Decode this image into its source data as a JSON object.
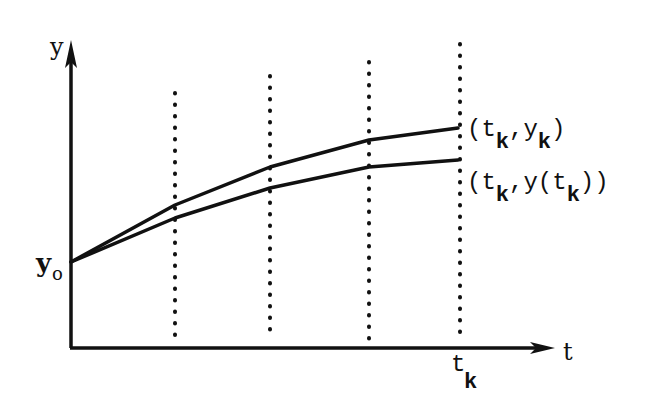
{
  "diagram": {
    "type": "numerical-solution-illustration",
    "axes": {
      "y_label": "y",
      "t_label": "t",
      "y0_label": "y",
      "y0_sub": "o",
      "tk_label": "t",
      "tk_sub": "k"
    },
    "grid_lines": [
      {
        "x": 175,
        "top": 93
      },
      {
        "x": 270,
        "top": 76
      },
      {
        "x": 369,
        "top": 62
      },
      {
        "x": 460,
        "top": 44
      }
    ],
    "curves": {
      "approx": {
        "name": "numerical approximation",
        "points": [
          [
            71,
            262
          ],
          [
            175,
            205
          ],
          [
            270,
            167
          ],
          [
            369,
            140
          ],
          [
            458,
            128
          ]
        ]
      },
      "exact": {
        "name": "exact solution",
        "points": [
          [
            71,
            262
          ],
          [
            175,
            218
          ],
          [
            270,
            188
          ],
          [
            369,
            167
          ],
          [
            458,
            160
          ]
        ]
      }
    },
    "end_labels": {
      "approx": {
        "open": "(t",
        "sub1": "k",
        "mid": ",y",
        "sub2": "k",
        "close": ")"
      },
      "exact": {
        "open": "(t",
        "sub1": "k",
        "mid": ",y(t",
        "sub2": "k",
        "close": "))"
      }
    },
    "colors": {
      "ink": "#111111",
      "background": "#ffffff"
    }
  }
}
